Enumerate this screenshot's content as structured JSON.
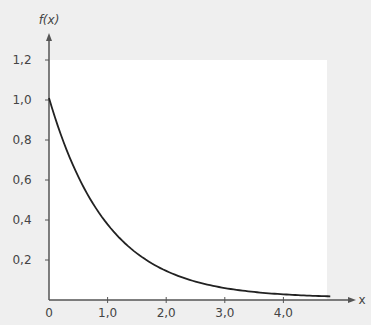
{
  "chart_data": {
    "type": "line",
    "title": "",
    "xlabel": "x",
    "ylabel": "f(x)",
    "function": "f(x) = e^(-x)",
    "xlim": [
      0,
      4.8
    ],
    "ylim": [
      0,
      1.2
    ],
    "x_ticks": [
      0,
      1.0,
      2.0,
      3.0,
      4.0
    ],
    "x_tick_labels": [
      "0",
      "1,0",
      "2,0",
      "3,0",
      "4,0"
    ],
    "y_ticks": [
      0.2,
      0.4,
      0.6,
      0.8,
      1.0,
      1.2
    ],
    "y_tick_labels": [
      "0,2",
      "0,4",
      "0,6",
      "0,8",
      "1,0",
      "1,2"
    ],
    "grid": false,
    "legend": null,
    "series": [
      {
        "name": "f(x)",
        "x": [
          0,
          0.25,
          0.5,
          0.75,
          1.0,
          1.5,
          2.0,
          2.5,
          3.0,
          3.5,
          4.0,
          4.5,
          4.8
        ],
        "values": [
          1.0,
          0.78,
          0.61,
          0.47,
          0.37,
          0.22,
          0.14,
          0.08,
          0.05,
          0.03,
          0.02,
          0.01,
          0.01
        ]
      }
    ],
    "colors": {
      "curve": "#222222",
      "axis": "#555555",
      "plot_bg": "#ffffff",
      "page_bg": "#efefef"
    }
  }
}
